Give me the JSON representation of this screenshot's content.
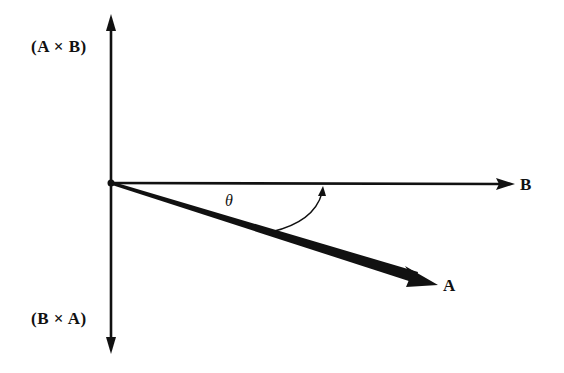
{
  "diagram": {
    "labels": {
      "axis_up": "(A × B)",
      "axis_down": "(B × A)",
      "vector_b": "B",
      "vector_a": "A",
      "angle": "θ"
    },
    "colors": {
      "ink": "#111111",
      "background": "#ffffff"
    },
    "geometry": {
      "origin": [
        111,
        183
      ],
      "axis_top": [
        111,
        15
      ],
      "axis_bottom": [
        111,
        353
      ],
      "vector_b_tip": [
        514,
        184
      ],
      "vector_a_tip": [
        438,
        284
      ],
      "angle_arc_start": [
        271,
        232
      ],
      "angle_arc_end": [
        323,
        186
      ]
    }
  }
}
